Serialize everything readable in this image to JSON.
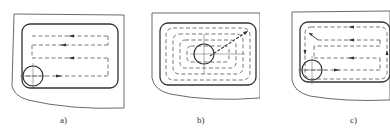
{
  "figure": {
    "panels": [
      {
        "id": "a",
        "label": "a)",
        "strategy": "zig-zag parallel passes"
      },
      {
        "id": "b",
        "label": "b)",
        "strategy": "contour-parallel spiral from center"
      },
      {
        "id": "c",
        "label": "c)",
        "strategy": "zig-zag passes with final contour pass"
      }
    ]
  },
  "colors": {
    "line": "#333333",
    "dash": "#555555",
    "background": "#ffffff"
  }
}
